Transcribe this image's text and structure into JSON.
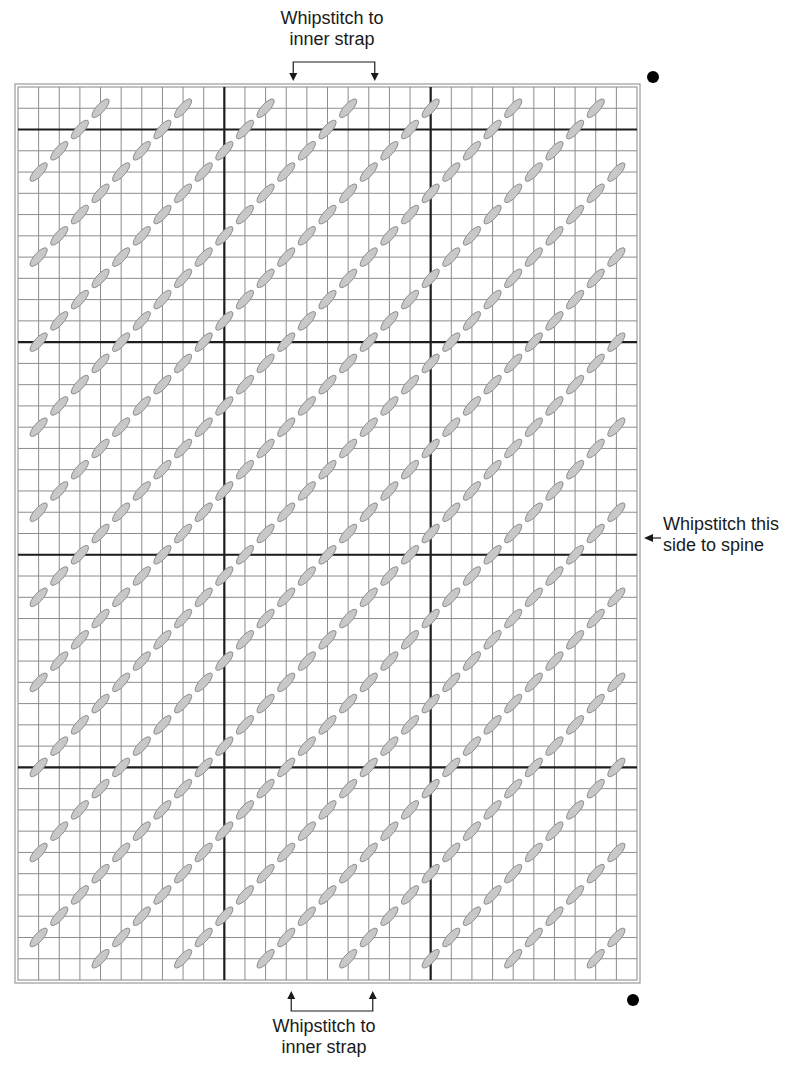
{
  "diagram": {
    "type": "plastic-canvas stitch chart",
    "grid": {
      "columns": 30,
      "rows": 42,
      "heavy_line_every_columns_at": [
        10,
        20
      ],
      "heavy_line_every_rows_at": [
        2,
        12,
        22,
        32
      ]
    },
    "stitch": {
      "kind": "diagonal slanted stitch",
      "direction": "bottom-left to top-right",
      "rule": "on grid intersections where (column_line + row_line) mod 4 == 1",
      "color": "#c8c8c8",
      "outline": "#8a8a8a"
    },
    "colors": {
      "grid_line": "#8c8c8c",
      "heavy_line": "#1e1e1e",
      "border": "#9a9a9a",
      "marker_dot": "#000000"
    },
    "markers": [
      {
        "name": "top-right-dot",
        "position": "top-right corner"
      },
      {
        "name": "bottom-right-dot",
        "position": "bottom-right corner"
      }
    ]
  },
  "annotations": {
    "top": {
      "line1": "Whipstitch to",
      "line2": "inner strap",
      "bracket_columns": [
        13,
        17
      ]
    },
    "bottom": {
      "line1": "Whipstitch to",
      "line2": "inner strap",
      "bracket_columns": [
        13,
        17
      ]
    },
    "right": {
      "line1": "Whipstitch this",
      "line2": "side to spine"
    }
  }
}
